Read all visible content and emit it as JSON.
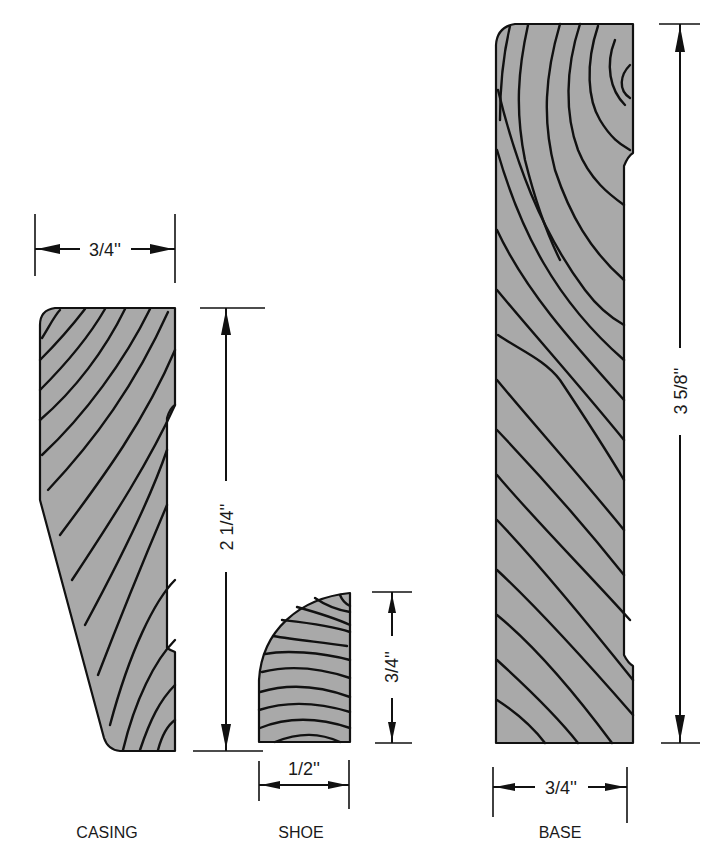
{
  "figure": {
    "type": "molding cross-section diagram",
    "colors": {
      "wood_fill": "#a9a9a9",
      "line": "#111111",
      "background": "#ffffff"
    },
    "profiles": [
      {
        "id": "casing",
        "label": "CASING",
        "width_label": "3/4''",
        "height_label": "2 1/4''"
      },
      {
        "id": "shoe",
        "label": "SHOE",
        "width_label": "1/2''",
        "height_label": "3/4''"
      },
      {
        "id": "base",
        "label": "BASE",
        "width_label": "3/4''",
        "height_label": "3 5/8''"
      }
    ]
  }
}
